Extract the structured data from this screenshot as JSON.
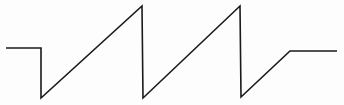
{
  "diagram": {
    "type": "waveform",
    "stroke_color": "#1a1a1a",
    "stroke_width": 1.6,
    "background": "#fdfdfd",
    "points": [
      [
        6,
        48
      ],
      [
        41,
        48
      ],
      [
        41,
        98
      ],
      [
        142,
        6
      ],
      [
        143,
        98
      ],
      [
        240,
        6
      ],
      [
        241,
        97
      ],
      [
        290,
        51
      ],
      [
        337,
        51
      ]
    ],
    "segments": [
      {
        "name": "initial-baseline",
        "from": [
          6,
          48
        ],
        "to": [
          41,
          48
        ]
      },
      {
        "name": "initial-drop",
        "from": [
          41,
          48
        ],
        "to": [
          41,
          98
        ]
      },
      {
        "name": "ramp-1",
        "from": [
          41,
          98
        ],
        "to": [
          142,
          6
        ]
      },
      {
        "name": "flyback-1",
        "from": [
          142,
          6
        ],
        "to": [
          143,
          98
        ]
      },
      {
        "name": "ramp-2",
        "from": [
          143,
          98
        ],
        "to": [
          240,
          6
        ]
      },
      {
        "name": "flyback-2",
        "from": [
          240,
          6
        ],
        "to": [
          241,
          97
        ]
      },
      {
        "name": "partial-ramp",
        "from": [
          241,
          97
        ],
        "to": [
          290,
          51
        ]
      },
      {
        "name": "final-level",
        "from": [
          290,
          51
        ],
        "to": [
          337,
          51
        ]
      }
    ]
  }
}
